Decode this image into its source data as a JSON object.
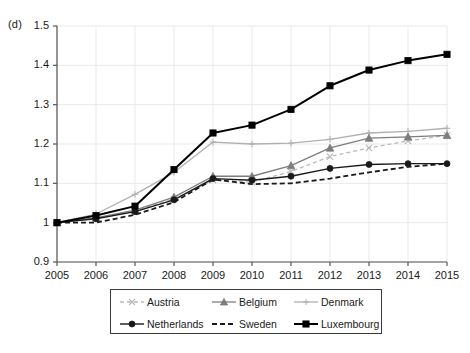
{
  "panel": {
    "label": "(d)"
  },
  "chart_data": {
    "type": "line",
    "title": "",
    "subtitle": "",
    "xlabel": "",
    "ylabel": "",
    "x": [
      2005,
      2006,
      2007,
      2008,
      2009,
      2010,
      2011,
      2012,
      2013,
      2014,
      2015
    ],
    "categories": [
      "2005",
      "2006",
      "2007",
      "2008",
      "2009",
      "2010",
      "2011",
      "2012",
      "2013",
      "2014",
      "2015"
    ],
    "xlim": [
      2005,
      2015
    ],
    "ylim": [
      0.9,
      1.5
    ],
    "ytick_labels": [
      "0.9",
      "1",
      "1.1",
      "1.2",
      "1.3",
      "1.4",
      "1.5"
    ],
    "ytick_values": [
      0.9,
      1.0,
      1.1,
      1.2,
      1.3,
      1.4,
      1.5
    ],
    "grid": true,
    "grid_axis": "both",
    "legend_position": "bottom",
    "legend_columns": 3,
    "series": [
      {
        "name": "Austria",
        "color": "#b9b9b9",
        "dash": "4,3",
        "width": 1.3,
        "marker": "x",
        "values": [
          1.0,
          1.012,
          1.03,
          1.06,
          1.108,
          1.103,
          1.13,
          1.168,
          1.19,
          1.208,
          1.222
        ]
      },
      {
        "name": "Belgium",
        "color": "#7d7d7d",
        "dash": "none",
        "width": 1.3,
        "marker": "triangle",
        "values": [
          1.0,
          1.012,
          1.032,
          1.065,
          1.118,
          1.118,
          1.145,
          1.19,
          1.215,
          1.218,
          1.222
        ]
      },
      {
        "name": "Denmark",
        "color": "#b0b0b0",
        "dash": "none",
        "width": 1.3,
        "marker": "plus",
        "values": [
          1.0,
          1.022,
          1.072,
          1.128,
          1.205,
          1.2,
          1.202,
          1.212,
          1.228,
          1.232,
          1.24
        ]
      },
      {
        "name": "Netherlands",
        "color": "#1a1a1a",
        "dash": "none",
        "width": 1.4,
        "marker": "circle",
        "values": [
          1.0,
          1.01,
          1.028,
          1.058,
          1.112,
          1.108,
          1.118,
          1.138,
          1.148,
          1.15,
          1.15
        ]
      },
      {
        "name": "Sweden",
        "color": "#1a1a1a",
        "dash": "5,3",
        "width": 1.8,
        "marker": "none",
        "values": [
          1.0,
          1.0,
          1.02,
          1.052,
          1.11,
          1.098,
          1.1,
          1.112,
          1.128,
          1.142,
          1.15
        ]
      },
      {
        "name": "Luxembourg",
        "color": "#000000",
        "dash": "none",
        "width": 2.0,
        "marker": "square",
        "values": [
          1.0,
          1.018,
          1.042,
          1.135,
          1.228,
          1.248,
          1.288,
          1.348,
          1.388,
          1.412,
          1.428
        ]
      }
    ]
  }
}
